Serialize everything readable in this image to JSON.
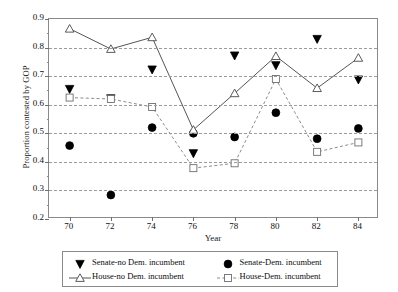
{
  "chart_data": {
    "type": "line",
    "title": "",
    "xlabel": "Year",
    "ylabel": "Proportion contested by GOP",
    "x": [
      70,
      72,
      74,
      76,
      78,
      80,
      82,
      84
    ],
    "categories": [
      "70",
      "72",
      "74",
      "76",
      "78",
      "80",
      "82",
      "84"
    ],
    "xlim": [
      69,
      85
    ],
    "ylim": [
      0.2,
      0.9
    ],
    "yticks": [
      "0.9",
      "0.8",
      "0.7",
      "0.6",
      "0.5",
      "0.4",
      "0.3",
      "0.2"
    ],
    "ytick_values": [
      0.9,
      0.8,
      0.7,
      0.6,
      0.5,
      0.4,
      0.3,
      0.2
    ],
    "grid": "horizontal-dashed",
    "legend_position": "below-center",
    "series": [
      {
        "name": "Senate-no Dem. incumbent",
        "marker": "triangle-down-filled",
        "line": "none",
        "color": "#000000",
        "values": [
          0.655,
          0.622,
          0.723,
          0.43,
          0.772,
          0.738,
          0.83,
          0.688
        ]
      },
      {
        "name": "Senate-Dem. incumbent",
        "marker": "circle-filled",
        "line": "none",
        "color": "#000000",
        "values": [
          0.457,
          0.284,
          0.52,
          0.5,
          0.487,
          0.572,
          0.481,
          0.517
        ]
      },
      {
        "name": "House-no Dem. incumbent",
        "marker": "triangle-up-open",
        "line": "solid",
        "color": "#555555",
        "values": [
          0.866,
          0.795,
          0.836,
          0.512,
          0.64,
          0.77,
          0.658,
          0.764
        ]
      },
      {
        "name": "House-Dem. incumbent",
        "marker": "square-open",
        "line": "dashed",
        "color": "#8c8c8c",
        "values": [
          0.625,
          0.62,
          0.592,
          0.378,
          0.395,
          0.69,
          0.435,
          0.468
        ]
      }
    ]
  },
  "legend": {
    "entries": [
      {
        "label": "Senate-no Dem. incumbent"
      },
      {
        "label": "Senate-Dem. incumbent"
      },
      {
        "label": "House-no Dem. incumbent"
      },
      {
        "label": "House-Dem. incumbent"
      }
    ]
  }
}
